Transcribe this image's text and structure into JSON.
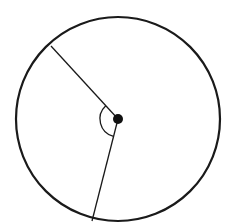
{
  "diagram": {
    "type": "circle-with-central-angle",
    "stroke_color": "#1a1a1a",
    "background": "#ffffff",
    "circle": {
      "cx": 118,
      "cy": 119,
      "r": 102
    },
    "center_point": {
      "x": 118,
      "y": 119,
      "r": 5
    },
    "radii": [
      {
        "name": "radius-upper-left",
        "x2": 51,
        "y2": 46
      },
      {
        "name": "radius-lower",
        "x2": 92,
        "y2": 221
      }
    ],
    "angle_arc": {
      "r": 18
    }
  }
}
